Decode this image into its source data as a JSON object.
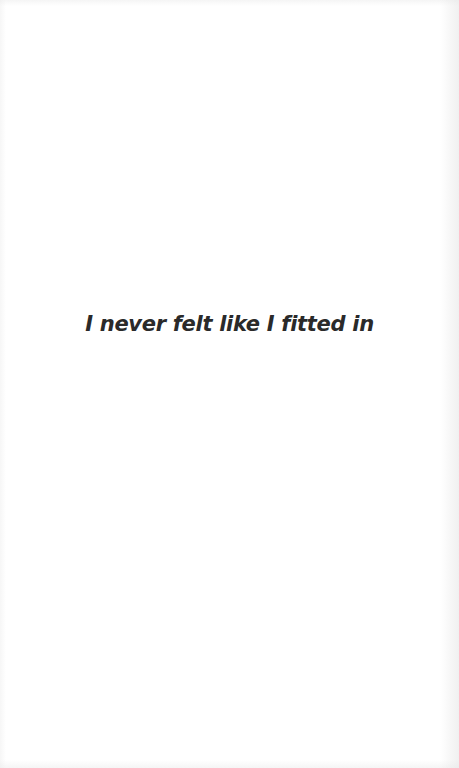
{
  "page": {
    "text": "I never felt like I fitted in",
    "text_color": "#2a2a2a",
    "background_color": "#ffffff"
  }
}
